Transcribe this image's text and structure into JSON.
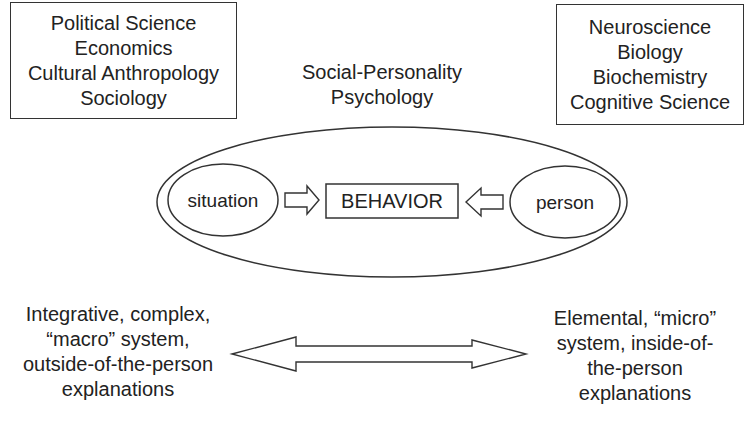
{
  "left_box": {
    "lines": [
      "Political Science",
      "Economics",
      "Cultural Anthropology",
      "Sociology"
    ]
  },
  "right_box": {
    "lines": [
      "Neuroscience",
      "Biology",
      "Biochemistry",
      "Cognitive Science"
    ]
  },
  "center_label": {
    "lines": [
      "Social-Personality",
      "Psychology"
    ]
  },
  "diagram": {
    "situation": "situation",
    "behavior": "BEHAVIOR",
    "person": "person"
  },
  "bottom_left": {
    "lines": [
      "Integrative, complex,",
      "“macro” system,",
      "outside-of-the-person",
      "explanations"
    ]
  },
  "bottom_right": {
    "lines": [
      "Elemental, “micro”",
      "system, inside-of-",
      "the-person",
      "explanations"
    ]
  },
  "colors": {
    "stroke": "#333333",
    "text": "#222222",
    "background": "#ffffff"
  }
}
